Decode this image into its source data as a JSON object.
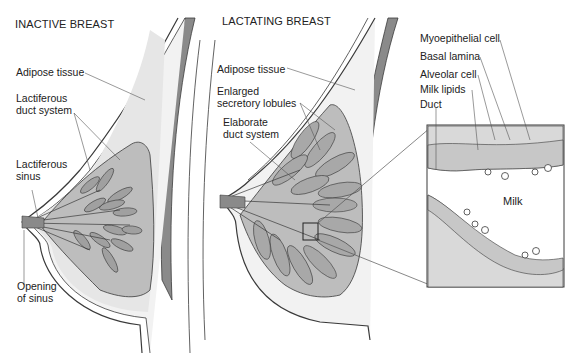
{
  "panels": [
    {
      "title": "INACTIVE BREAST",
      "labels": [
        {
          "id": "adipose",
          "text": "Adipose tissue"
        },
        {
          "id": "duct-system",
          "lines": [
            "Lactiferous",
            "duct system"
          ]
        },
        {
          "id": "sinus",
          "lines": [
            "Lactiferous",
            "sinus"
          ]
        },
        {
          "id": "opening",
          "lines": [
            "Opening",
            "of sinus"
          ]
        }
      ]
    },
    {
      "title": "LACTATING BREAST",
      "labels": [
        {
          "id": "adipose",
          "text": "Adipose tissue"
        },
        {
          "id": "lobules",
          "lines": [
            "Enlarged",
            "secretory lobules"
          ]
        },
        {
          "id": "duct-system",
          "lines": [
            "Elaborate",
            "duct system"
          ]
        }
      ]
    },
    {
      "title": "",
      "inset_labels": [
        {
          "id": "myoepithelial",
          "text": "Myoepithelial cell"
        },
        {
          "id": "basal-lamina",
          "text": "Basal lamina"
        },
        {
          "id": "alveolar",
          "text": "Alveolar cell"
        },
        {
          "id": "milk-lipids",
          "text": "Milk lipids"
        },
        {
          "id": "duct",
          "text": "Duct"
        }
      ],
      "lumen_label": "Milk"
    }
  ],
  "colors": {
    "outline": "#3a3a3a",
    "skin": "#f2f2f2",
    "muscle": "#8a8a8a",
    "gland": "#bdbdbd",
    "lobule": "#a8a8a8",
    "stroma": "#d9d9d9",
    "leader": "#555555"
  }
}
